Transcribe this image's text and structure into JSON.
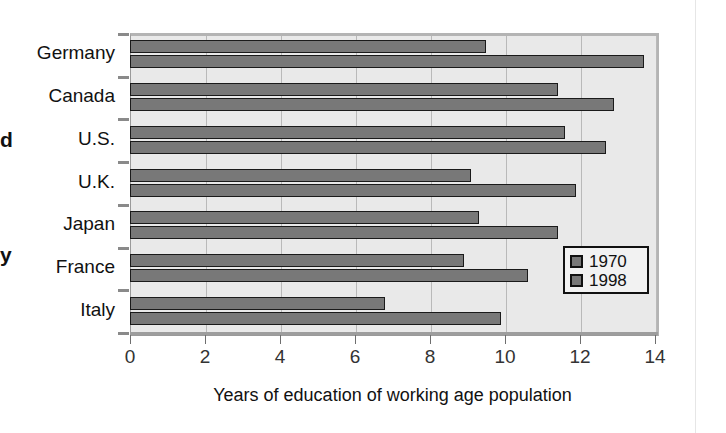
{
  "page": {
    "left_margin_artifact_top": "d",
    "left_margin_artifact_bottom": "y"
  },
  "chart_data": {
    "type": "bar",
    "orientation": "horizontal",
    "title": "",
    "subtitle": "",
    "xlabel": "Years of education of working age population",
    "ylabel": "",
    "categories": [
      "Germany",
      "Canada",
      "U.S.",
      "U.K.",
      "Japan",
      "France",
      "Italy"
    ],
    "series": [
      {
        "name": "1970",
        "color": "#787878",
        "values": [
          9.5,
          11.4,
          11.6,
          9.1,
          9.3,
          8.9,
          6.8
        ]
      },
      {
        "name": "1998",
        "color": "#787878",
        "values": [
          13.7,
          12.9,
          12.7,
          11.9,
          11.4,
          10.6,
          9.9
        ]
      }
    ],
    "xlim": [
      0,
      14
    ],
    "xticks": [
      0,
      2,
      4,
      6,
      8,
      10,
      12,
      14
    ],
    "xticklabels": [
      "0",
      "2",
      "4",
      "6",
      "8",
      "10",
      "12",
      "14"
    ],
    "grid": "vertical",
    "legend_position": "inside-right-lower",
    "legend_entries": [
      "1970",
      "1998"
    ],
    "plot_background": "#e9e9e9",
    "bar_edge_color": "#1a1a1a",
    "gridline_color": "#b9b9b9"
  }
}
